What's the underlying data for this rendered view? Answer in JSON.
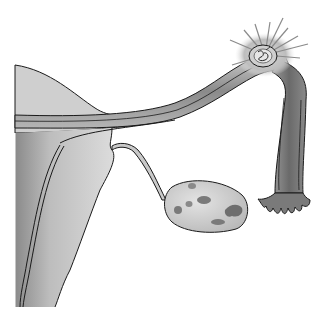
{
  "figure": {
    "parts": [
      {
        "id": "uterus",
        "label": "uterus"
      },
      {
        "id": "fallopian-tube",
        "label": "fallopian tube"
      },
      {
        "id": "fertilized-egg",
        "label": "egg with sperm (fertilization)"
      },
      {
        "id": "fimbriae",
        "label": "fimbriae"
      },
      {
        "id": "ovary",
        "label": "ovary"
      },
      {
        "id": "ovarian-ligament",
        "label": "ovarian ligament"
      }
    ],
    "top_fragments": [
      "ɡ",
      "ɡ"
    ],
    "colors": {
      "background": "#ffffff",
      "outline": "#1a1a1a",
      "light_fill": "#d9d9d9",
      "mid_fill": "#a8a8a8",
      "dark_fill": "#6e6e6e",
      "glow": "#c8c8c8"
    }
  }
}
